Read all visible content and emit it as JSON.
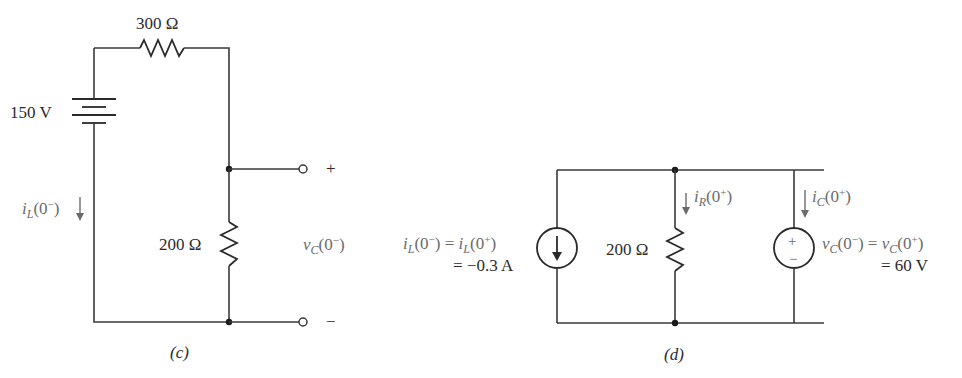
{
  "figure": {
    "panel_c": {
      "caption": "(c)",
      "battery_label": "150 V",
      "series_resistor_label": "300 Ω",
      "shunt_resistor_label": "200 Ω",
      "current_label": {
        "var": "i",
        "sub": "L",
        "arg": "(0",
        "sup": "−",
        "close": ")"
      },
      "voltage_label": {
        "var": "v",
        "sub": "C",
        "arg": "(0",
        "sup": "−",
        "close": ")"
      },
      "plus_terminal": "+",
      "minus_terminal": "−"
    },
    "panel_d": {
      "caption": "(d)",
      "resistor_label": "200 Ω",
      "current_source_eq_line1": {
        "lhs_var": "i",
        "lhs_sub": "L",
        "lhs_arg": "(0",
        "lhs_sup": "−",
        "eq": ") = ",
        "rhs_var": "i",
        "rhs_sub": "L",
        "rhs_arg": "(0",
        "rhs_sup": "+",
        "close": ")"
      },
      "current_source_eq_line2": "= −0.3 A",
      "ir_label": {
        "var": "i",
        "sub": "R",
        "arg": "(0",
        "sup": "+",
        "close": ")"
      },
      "ic_label": {
        "var": "i",
        "sub": "C",
        "arg": "(0",
        "sup": "+",
        "close": ")"
      },
      "voltage_source_eq_line1": {
        "lhs_var": "v",
        "lhs_sub": "C",
        "lhs_arg": "(0",
        "lhs_sup": "−",
        "eq": ") = ",
        "rhs_var": "v",
        "rhs_sub": "C",
        "rhs_arg": "(0",
        "rhs_sup": "+",
        "close": ")"
      },
      "voltage_source_eq_line2": "= 60 V",
      "source_plus": "+",
      "source_minus": "−"
    }
  }
}
